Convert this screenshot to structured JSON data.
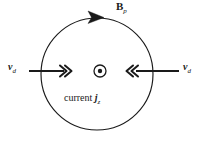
{
  "figure": {
    "kind": "physics-field-diagram",
    "width": 202,
    "height": 143,
    "background_color": "#ffffff",
    "stroke_color": "#1a1a1a"
  },
  "field_loop": {
    "center_x": 97,
    "center_y": 74,
    "radius": 56,
    "direction": "clockwise",
    "label_symbol": "B",
    "label_subscript": "p",
    "arrowhead_shape": "solid-triangle"
  },
  "current_marker": {
    "symbol": "circled-dot",
    "meaning": "out-of-page",
    "center_x": 100,
    "center_y": 71,
    "outer_radius": 6,
    "inner_radius": 2.2
  },
  "current_label": {
    "text": "current",
    "symbol": "j",
    "subscript": "z"
  },
  "velocity_left": {
    "symbol": "v",
    "subscript": "d",
    "direction": "right",
    "arrowhead_shape": "double-chevron",
    "tail_x": 29,
    "head_x": 70,
    "y": 71
  },
  "velocity_right": {
    "symbol": "v",
    "subscript": "d",
    "direction": "left",
    "arrowhead_shape": "double-chevron",
    "tail_x": 179,
    "head_x": 129,
    "y": 71
  }
}
